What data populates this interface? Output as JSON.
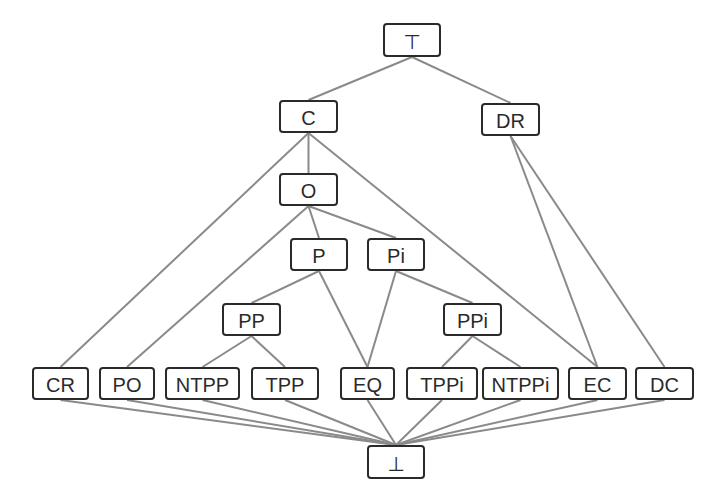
{
  "diagram": {
    "colors": {
      "node_border": "#2a2a2a",
      "edge": "#8a8a8a",
      "background": "#ffffff",
      "text": "#2a2a2a"
    },
    "nodes": [
      {
        "id": "top",
        "label": "⊤",
        "x": 383,
        "y": 23,
        "w": 58,
        "h": 34
      },
      {
        "id": "C",
        "label": "C",
        "x": 279,
        "y": 100,
        "w": 59,
        "h": 33
      },
      {
        "id": "DR",
        "label": "DR",
        "x": 481,
        "y": 103,
        "w": 59,
        "h": 33
      },
      {
        "id": "O",
        "label": "O",
        "x": 279,
        "y": 173,
        "w": 59,
        "h": 33
      },
      {
        "id": "P",
        "label": "P",
        "x": 290,
        "y": 238,
        "w": 58,
        "h": 33
      },
      {
        "id": "Pi",
        "label": "Pi",
        "x": 367,
        "y": 238,
        "w": 58,
        "h": 33
      },
      {
        "id": "PP",
        "label": "PP",
        "x": 222,
        "y": 303,
        "w": 59,
        "h": 33
      },
      {
        "id": "PPi",
        "label": "PPi",
        "x": 443,
        "y": 303,
        "w": 59,
        "h": 33
      },
      {
        "id": "CR",
        "label": "CR",
        "x": 32,
        "y": 367,
        "w": 57,
        "h": 33
      },
      {
        "id": "PO",
        "label": "PO",
        "x": 99,
        "y": 367,
        "w": 56,
        "h": 33
      },
      {
        "id": "NTPP",
        "label": "NTPP",
        "x": 165,
        "y": 367,
        "w": 75,
        "h": 33
      },
      {
        "id": "TPP",
        "label": "TPP",
        "x": 251,
        "y": 367,
        "w": 68,
        "h": 33
      },
      {
        "id": "EQ",
        "label": "EQ",
        "x": 340,
        "y": 367,
        "w": 55,
        "h": 33
      },
      {
        "id": "TPPi",
        "label": "TPPi",
        "x": 406,
        "y": 367,
        "w": 72,
        "h": 33
      },
      {
        "id": "NTPPi",
        "label": "NTPPi",
        "x": 482,
        "y": 367,
        "w": 77,
        "h": 33
      },
      {
        "id": "EC",
        "label": "EC",
        "x": 568,
        "y": 367,
        "w": 59,
        "h": 33
      },
      {
        "id": "DC",
        "label": "DC",
        "x": 635,
        "y": 367,
        "w": 59,
        "h": 33
      },
      {
        "id": "bottom",
        "label": "⊥",
        "x": 367,
        "y": 445,
        "w": 58,
        "h": 34
      }
    ],
    "edges": [
      [
        "top",
        "C"
      ],
      [
        "top",
        "DR"
      ],
      [
        "C",
        "O"
      ],
      [
        "C",
        "CR"
      ],
      [
        "C",
        "EC"
      ],
      [
        "DR",
        "EC"
      ],
      [
        "DR",
        "DC"
      ],
      [
        "O",
        "P"
      ],
      [
        "O",
        "Pi"
      ],
      [
        "O",
        "PO"
      ],
      [
        "P",
        "PP"
      ],
      [
        "P",
        "EQ"
      ],
      [
        "Pi",
        "EQ"
      ],
      [
        "Pi",
        "PPi"
      ],
      [
        "PP",
        "NTPP"
      ],
      [
        "PP",
        "TPP"
      ],
      [
        "PPi",
        "TPPi"
      ],
      [
        "PPi",
        "NTPPi"
      ],
      [
        "CR",
        "bottom"
      ],
      [
        "PO",
        "bottom"
      ],
      [
        "NTPP",
        "bottom"
      ],
      [
        "TPP",
        "bottom"
      ],
      [
        "EQ",
        "bottom"
      ],
      [
        "TPPi",
        "bottom"
      ],
      [
        "NTPPi",
        "bottom"
      ],
      [
        "EC",
        "bottom"
      ],
      [
        "DC",
        "bottom"
      ]
    ]
  }
}
